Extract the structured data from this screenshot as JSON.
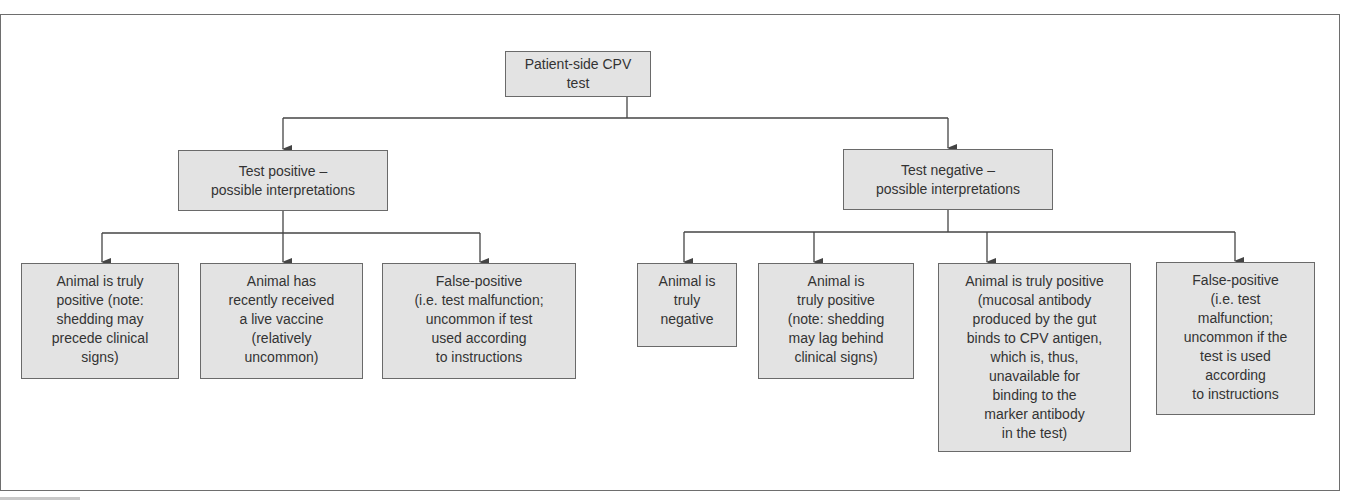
{
  "diagram": {
    "root": {
      "label": "Patient-side CPV test"
    },
    "branches": [
      {
        "label": "Test positive –\npossible interpretations",
        "children": [
          {
            "label": "Animal is truly\npositive (note:\nshedding may\nprecede clinical\nsigns)"
          },
          {
            "label": "Animal has\nrecently received\na live vaccine\n(relatively\nuncommon)"
          },
          {
            "label": "False-positive\n(i.e. test malfunction;\nuncommon if test\nused according\nto instructions"
          }
        ]
      },
      {
        "label": "Test negative –\npossible interpretations",
        "children": [
          {
            "label": "Animal is\ntruly\nnegative"
          },
          {
            "label": "Animal is\ntruly positive\n(note: shedding\nmay lag behind\nclinical signs)"
          },
          {
            "label": "Animal is truly positive\n(mucosal antibody\nproduced by the gut\nbinds to CPV antigen,\nwhich is, thus,\nunavailable for\nbinding to the\nmarker antibody\nin the test)"
          },
          {
            "label": "False-positive\n(i.e. test\nmalfunction;\nuncommon if the\ntest is used\naccording\nto instructions"
          }
        ]
      }
    ]
  },
  "colors": {
    "node_fill": "#e3e3e3",
    "node_border": "#6a6a6a",
    "text": "#333333",
    "line": "#444444"
  }
}
